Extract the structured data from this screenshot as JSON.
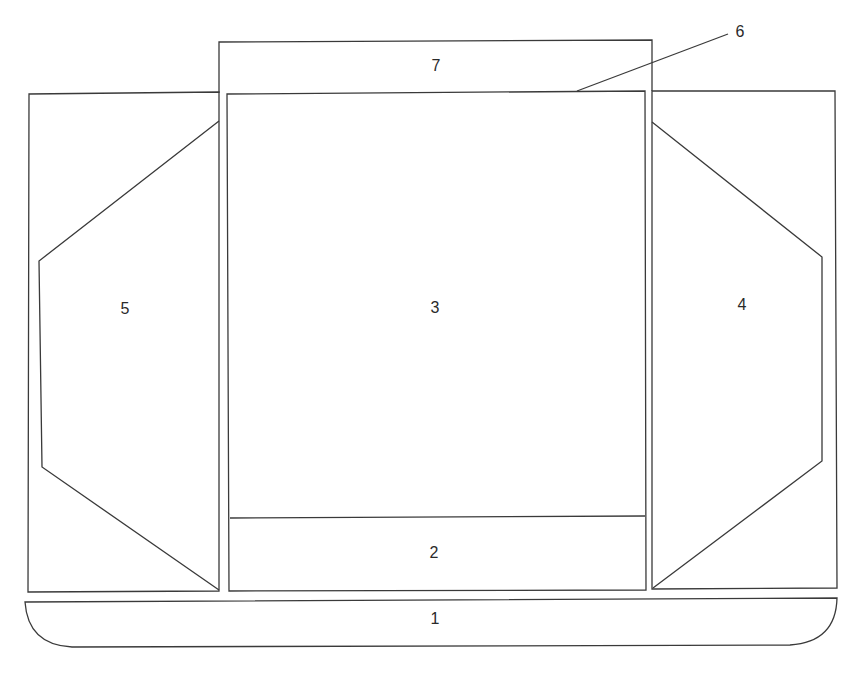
{
  "diagram": {
    "type": "box-net / carton layout",
    "labels": {
      "1": "1",
      "2": "2",
      "3": "3",
      "4": "4",
      "5": "5",
      "6": "6",
      "7": "7"
    },
    "parts": [
      {
        "id": "1",
        "description": "bottom base strip with rounded lower corners"
      },
      {
        "id": "2",
        "description": "lower band of central panel"
      },
      {
        "id": "3",
        "description": "central main panel"
      },
      {
        "id": "4",
        "description": "right side panel with hexagonal flap outline"
      },
      {
        "id": "5",
        "description": "left side panel with hexagonal flap outline"
      },
      {
        "id": "6",
        "description": "leader line pointing to top edge of central panel"
      },
      {
        "id": "7",
        "description": "top flap above central panel"
      }
    ],
    "stroke_color": "#3a3a3a",
    "background": "#ffffff"
  }
}
